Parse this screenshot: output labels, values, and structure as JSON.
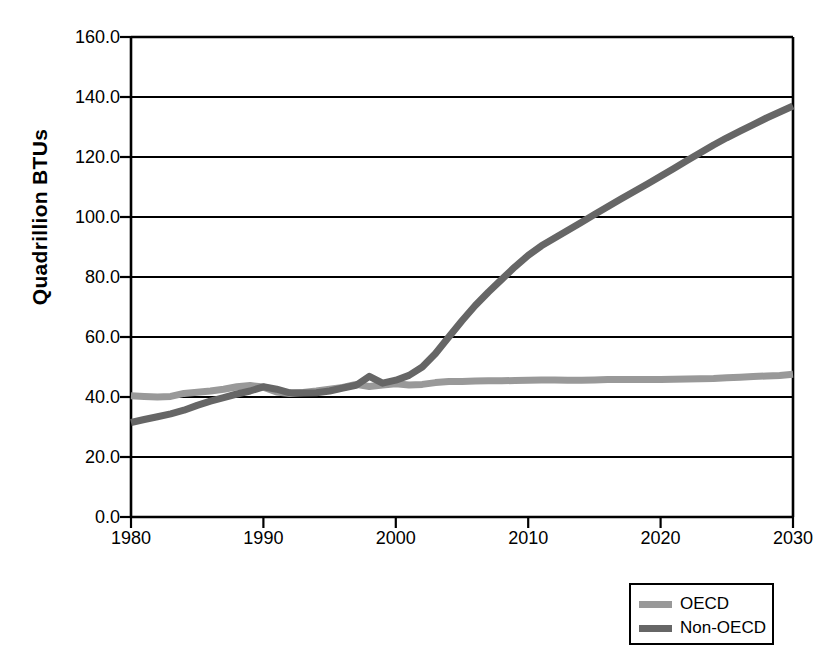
{
  "chart_data": {
    "type": "line",
    "title": "",
    "xlabel": "",
    "ylabel": "Quadrillion BTUs",
    "xlim": [
      1980,
      2030
    ],
    "ylim": [
      0.0,
      160.0
    ],
    "grid": true,
    "legend_position": "bottom-right",
    "y_ticks": [
      "160.0",
      "140.0",
      "120.0",
      "100.0",
      "80.0",
      "60.0",
      "40.0",
      "20.0",
      "0.0"
    ],
    "y_tick_values": [
      160.0,
      140.0,
      120.0,
      100.0,
      80.0,
      60.0,
      40.0,
      20.0,
      0.0
    ],
    "x_ticks": [
      "1980",
      "1990",
      "2000",
      "2010",
      "2020",
      "2030"
    ],
    "x_tick_values": [
      1980,
      1990,
      2000,
      2010,
      2020,
      2030
    ],
    "x": [
      1980,
      1981,
      1982,
      1983,
      1984,
      1985,
      1986,
      1987,
      1988,
      1989,
      1990,
      1991,
      1992,
      1993,
      1994,
      1995,
      1996,
      1997,
      1998,
      1999,
      2000,
      2001,
      2002,
      2003,
      2004,
      2005,
      2006,
      2007,
      2008,
      2009,
      2010,
      2011,
      2012,
      2013,
      2014,
      2015,
      2016,
      2017,
      2018,
      2019,
      2020,
      2021,
      2022,
      2023,
      2024,
      2025,
      2026,
      2027,
      2028,
      2029,
      2030
    ],
    "series": [
      {
        "name": "OECD",
        "color": "#999999",
        "values": [
          40.4,
          40.2,
          40.0,
          40.2,
          41.2,
          41.6,
          42.0,
          42.6,
          43.4,
          43.8,
          43.3,
          41.7,
          41.2,
          41.5,
          42.0,
          42.6,
          43.2,
          44.2,
          43.5,
          44.0,
          44.4,
          44.0,
          44.2,
          44.8,
          45.2,
          45.2,
          45.3,
          45.4,
          45.4,
          45.5,
          45.6,
          45.7,
          45.7,
          45.6,
          45.6,
          45.7,
          45.8,
          45.8,
          45.8,
          45.8,
          45.8,
          45.9,
          46.0,
          46.1,
          46.2,
          46.4,
          46.6,
          46.8,
          47.0,
          47.2,
          47.6
        ]
      },
      {
        "name": "Non-OECD",
        "color": "#666666",
        "values": [
          31.5,
          32.5,
          33.4,
          34.4,
          35.6,
          37.2,
          38.6,
          39.8,
          41.0,
          42.0,
          43.4,
          42.6,
          41.4,
          41.3,
          41.4,
          42.0,
          43.0,
          43.9,
          46.9,
          44.6,
          45.6,
          47.2,
          50.0,
          54.5,
          60.0,
          65.4,
          70.5,
          75.0,
          79.2,
          83.4,
          87.2,
          90.4,
          93.0,
          95.6,
          98.2,
          100.8,
          103.4,
          106.0,
          108.5,
          111.0,
          113.6,
          116.2,
          118.8,
          121.4,
          124.0,
          126.4,
          128.6,
          130.8,
          133.0,
          135.0,
          137.0
        ]
      }
    ],
    "legend": [
      {
        "label": "OECD",
        "color": "#999999"
      },
      {
        "label": "Non-OECD",
        "color": "#666666"
      }
    ]
  },
  "axis": {
    "y_title": "Quadrillion BTUs"
  }
}
